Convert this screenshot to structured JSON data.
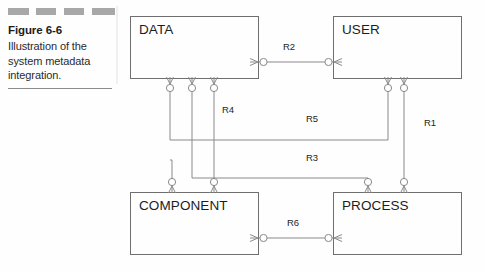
{
  "caption": {
    "figure_label": "Figure 6-6",
    "description": "Illustration of the system metadata integration.",
    "decorations": [
      "dash",
      "dash",
      "dash",
      "dash"
    ],
    "rule": "horizontal-rule"
  },
  "diagram": {
    "type": "entity-relationship-diagram",
    "notation": "crow's-foot",
    "entities": [
      {
        "id": "data",
        "label": "DATA",
        "x": 130,
        "y": 16,
        "w": 128,
        "h": 62
      },
      {
        "id": "user",
        "label": "USER",
        "x": 333,
        "y": 16,
        "w": 128,
        "h": 62
      },
      {
        "id": "component",
        "label": "COMPONENT",
        "x": 130,
        "y": 192,
        "w": 128,
        "h": 62
      },
      {
        "id": "process",
        "label": "PROCESS",
        "x": 333,
        "y": 192,
        "w": 128,
        "h": 62
      }
    ],
    "relationships": [
      {
        "id": "r1",
        "label": "R1",
        "from": "user",
        "to": "process",
        "label_x": 424,
        "label_y": 123
      },
      {
        "id": "r2",
        "label": "R2",
        "from": "data",
        "to": "user",
        "label_x": 283,
        "label_y": 47
      },
      {
        "id": "r3",
        "label": "R3",
        "from": "data",
        "to": "process",
        "label_x": 306,
        "label_y": 158
      },
      {
        "id": "r4",
        "label": "R4",
        "from": "data",
        "to": "component",
        "label_x": 222,
        "label_y": 110
      },
      {
        "id": "r5",
        "label": "R5",
        "from": "data",
        "to": "user",
        "label_x": 306,
        "label_y": 119
      },
      {
        "id": "r6",
        "label": "R6",
        "from": "component",
        "to": "process",
        "label_x": 287,
        "label_y": 223
      }
    ],
    "colors": {
      "box_stroke": "#6f6f6f",
      "line": "#8a8a8a",
      "text": "#1d1d1d",
      "dash": "#a8a8a8",
      "background": "#fefefe"
    }
  }
}
